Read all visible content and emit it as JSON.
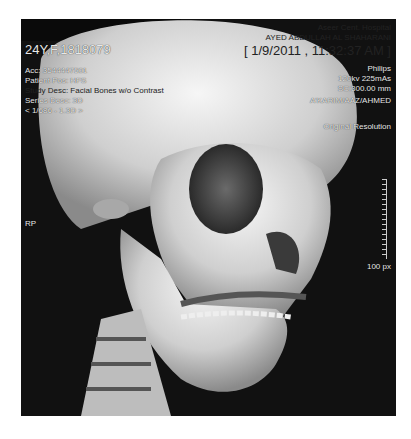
{
  "viewer": {
    "patient_line": "24Y,F,1818079",
    "acc": "Acc: 3544447501",
    "patient_pos": "Patient Pos: HFS",
    "study_desc": "Study Desc: Facial Bones w/o Contrast",
    "series_desc": "Series Desc: 3D",
    "series_nav": "< 1/686 - 1.3D >",
    "institution": "Aseer Cent. Hospital",
    "physician": "AYED ABDULLAH AL SHAHARANI",
    "datetime": "[ 1/9/2011 , 11:32:37 AM ]",
    "manufacturer": "Philips",
    "technique": "120kv 225mAs",
    "slice": "SC:300.00 mm",
    "operator": "A'KARIM/AAZ/AHMED",
    "resolution": "Original Resolution",
    "orientation": "RP",
    "scale_label": "100 px"
  },
  "colors": {
    "background": "#111111",
    "bone": "#d9d9d9",
    "text": "#e8e8e8"
  }
}
